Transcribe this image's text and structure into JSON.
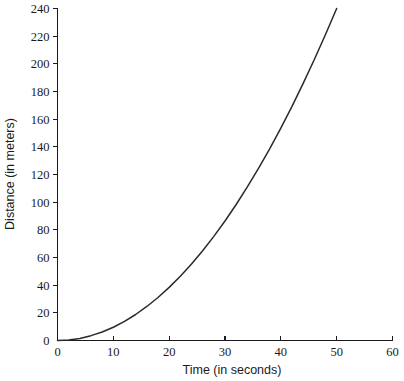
{
  "chart_data": {
    "type": "line",
    "title": "",
    "subtitle": "",
    "xlabel": "Time (in seconds)",
    "ylabel": "Distance (in meters)",
    "xlim": [
      0,
      60
    ],
    "ylim": [
      0,
      240
    ],
    "grid": false,
    "legend": null,
    "legend_position": "none",
    "annotations": [],
    "xticks": [
      0,
      10,
      20,
      30,
      40,
      50,
      60
    ],
    "xtick_labels": [
      "0",
      "10",
      "20",
      "30",
      "40",
      "50",
      "60"
    ],
    "yticks": [
      0,
      20,
      40,
      60,
      80,
      100,
      120,
      140,
      160,
      180,
      200,
      220,
      240
    ],
    "ytick_labels": [
      "0",
      "20",
      "40",
      "60",
      "80",
      "100",
      "120",
      "140",
      "160",
      "180",
      "200",
      "220",
      "240"
    ],
    "series": [
      {
        "name": "distance",
        "color": "#2a2a2a",
        "relation": "d = 0.096 * t^2",
        "x": [
          0,
          2,
          4,
          6,
          8,
          10,
          12,
          14,
          16,
          18,
          20,
          22,
          24,
          26,
          28,
          30,
          32,
          34,
          36,
          38,
          40,
          42,
          44,
          46,
          48,
          50
        ],
        "values": [
          0,
          0.4,
          1.5,
          3.5,
          6.1,
          9.6,
          13.8,
          18.8,
          24.6,
          31.1,
          38.4,
          46.5,
          55.3,
          64.9,
          75.3,
          86.4,
          98.3,
          111.0,
          124.4,
          138.6,
          153.6,
          169.3,
          185.9,
          203.1,
          221.2,
          240.0
        ]
      }
    ]
  },
  "axes": {
    "x_title": "Time (in seconds)",
    "y_title": "Distance (in meters)"
  },
  "colors": {
    "background": "#ffffff",
    "axis": "#1a1a1a",
    "curve": "#2a2a2a",
    "text": "#1a1a1a"
  }
}
